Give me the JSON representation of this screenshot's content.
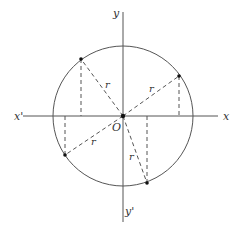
{
  "diagram": {
    "type": "unit-circle-radius-vectors",
    "center_label": "O",
    "axes": {
      "x_pos_label": "x",
      "x_neg_label": "x'",
      "y_pos_label": "y",
      "y_neg_label": "y'"
    },
    "radius_label": "r",
    "points": [
      {
        "quadrant": "I",
        "radius_label": "r"
      },
      {
        "quadrant": "II",
        "radius_label": "r"
      },
      {
        "quadrant": "III",
        "radius_label": "r"
      },
      {
        "quadrant": "IV",
        "radius_label": "r"
      }
    ]
  }
}
